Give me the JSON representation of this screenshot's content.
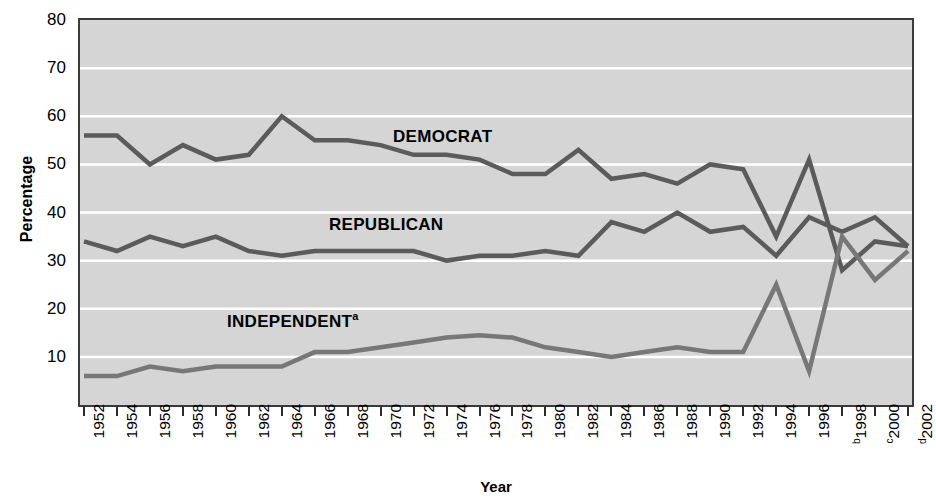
{
  "chart_data": {
    "type": "line",
    "title": "",
    "xlabel": "Year",
    "ylabel": "Percentage",
    "ylim": [
      0,
      80
    ],
    "yticks": [
      10,
      20,
      30,
      40,
      50,
      60,
      70,
      80
    ],
    "grid": true,
    "legend_position": "inline-annotations",
    "x": [
      "1952",
      "1954",
      "1956",
      "1958",
      "1960",
      "1962",
      "1964",
      "1966",
      "1968",
      "1970",
      "1972",
      "1974",
      "1976",
      "1978",
      "1980",
      "1982",
      "1984",
      "1986",
      "1988",
      "1990",
      "1992",
      "1994",
      "1996",
      "1998",
      "2000",
      "2002"
    ],
    "x_tick_labels": [
      "1952",
      "1954",
      "1956",
      "1958",
      "1960",
      "1962",
      "1964",
      "1966",
      "1968",
      "1970",
      "1972",
      "1974",
      "1976",
      "1978",
      "1980",
      "1982",
      "1984",
      "1986",
      "1988",
      "1990",
      "1992",
      "1994",
      "1996",
      "1998",
      "2000",
      "2002"
    ],
    "x_tick_superscripts": [
      "",
      "",
      "",
      "",
      "",
      "",
      "",
      "",
      "",
      "",
      "",
      "",
      "",
      "",
      "",
      "",
      "",
      "",
      "",
      "",
      "",
      "",
      "",
      "b",
      "c",
      "d"
    ],
    "series": [
      {
        "name": "DEMOCRAT",
        "superscript": "",
        "color": "#5b5b5b",
        "values": [
          56,
          56,
          50,
          54,
          51,
          52,
          60,
          55,
          55,
          54,
          52,
          52,
          51,
          48,
          48,
          53,
          47,
          48,
          46,
          50,
          49,
          35,
          51,
          28,
          34,
          33
        ]
      },
      {
        "name": "REPUBLICAN",
        "superscript": "",
        "color": "#5b5b5b",
        "values": [
          34,
          32,
          35,
          33,
          35,
          32,
          31,
          32,
          32,
          32,
          32,
          30,
          31,
          31,
          32,
          31,
          38,
          36,
          40,
          36,
          37,
          31,
          39,
          36,
          39,
          33
        ]
      },
      {
        "name": "INDEPENDENT",
        "superscript": "a",
        "color": "#777777",
        "values": [
          6,
          6,
          8,
          7,
          8,
          8,
          8,
          11,
          11,
          12,
          13,
          14,
          14.5,
          14,
          12,
          11,
          10,
          11,
          12,
          11,
          11,
          25,
          7,
          35,
          26,
          32
        ]
      }
    ],
    "annotations": [
      {
        "text": "DEMOCRAT",
        "superscript": "",
        "x_px": 393,
        "y_px": 127
      },
      {
        "text": "REPUBLICAN",
        "superscript": "",
        "x_px": 329,
        "y_px": 215
      },
      {
        "text": "INDEPENDENT",
        "superscript": "a",
        "x_px": 227,
        "y_px": 310
      }
    ],
    "colors": {
      "plot_background": "#d5d5d5",
      "gridline": "#ffffff",
      "axis": "#3a3a3a",
      "line_dark": "#5b5b5b",
      "line_light": "#777777",
      "text": "#000000"
    }
  }
}
